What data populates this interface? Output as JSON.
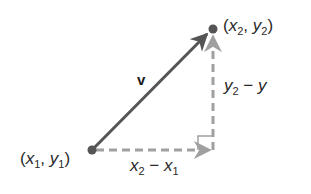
{
  "diagram": {
    "vector_label": "v",
    "point_start": {
      "label": "(x1, y1)",
      "x_var": "x",
      "x_sub": "1",
      "y_var": "y",
      "y_sub": "1",
      "px": [
        92,
        150
      ]
    },
    "point_end": {
      "label": "(x2, y2)",
      "x_var": "x",
      "x_sub": "2",
      "y_var": "y",
      "y_sub": "2",
      "px": [
        213,
        29
      ]
    },
    "horizontal_component": {
      "label": "x2 − x1",
      "a_var": "x",
      "a_sub": "2",
      "op": "−",
      "b_var": "x",
      "b_sub": "1"
    },
    "vertical_component": {
      "label": "y2 − y",
      "a_var": "y",
      "a_sub": "2",
      "op": "−",
      "b_var": "y"
    },
    "colors": {
      "vector": "#555555",
      "components": "#a0a0a0",
      "points": "#555555",
      "text": "#2a2a2a"
    }
  }
}
